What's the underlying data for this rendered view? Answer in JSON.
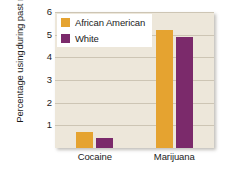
{
  "chart_data": {
    "type": "bar",
    "title": "",
    "xlabel": "",
    "ylabel_lines": [
      "Percentage using",
      "during past month"
    ],
    "ylabel": "Percentage using during past month",
    "categories": [
      "Cocaine",
      "Marijuana"
    ],
    "series": [
      {
        "name": "African American",
        "color": "#E5A330",
        "values": [
          0.7,
          5.2
        ]
      },
      {
        "name": "White",
        "color": "#7B2A6B",
        "values": [
          0.45,
          4.9
        ]
      }
    ],
    "ylim": [
      0,
      6
    ],
    "yticks": [
      1,
      2,
      3,
      4,
      5,
      6
    ],
    "ytick_labels": [
      "1",
      "2",
      "3",
      "4",
      "5",
      "6"
    ],
    "grid": true,
    "legend_position": "top-left",
    "plot_background": "#EDE7DA",
    "gridline_color": "#cdc5b4"
  }
}
